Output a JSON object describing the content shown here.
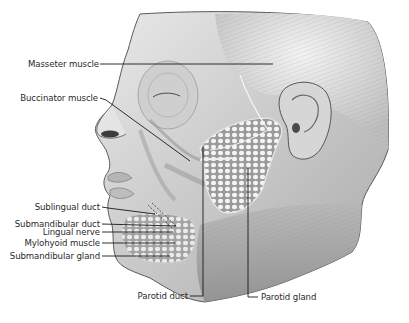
{
  "figure": {
    "colors": {
      "background": "#ffffff",
      "line": "#1a1a1a",
      "text": "#2a2a2a"
    }
  },
  "labels": {
    "masseter": "Masseter muscle",
    "buccinator": "Buccinator muscle",
    "sublingual_duct": "Sublingual duct",
    "submandibular_duct": "Submandibular duct",
    "lingual_nerve": "Lingual nerve",
    "mylohyoid": "Mylohyoid muscle",
    "submandibular_gland": "Submandibular gland",
    "parotid_duct": "Parotid duct",
    "parotid_gland": "Parotid gland"
  }
}
